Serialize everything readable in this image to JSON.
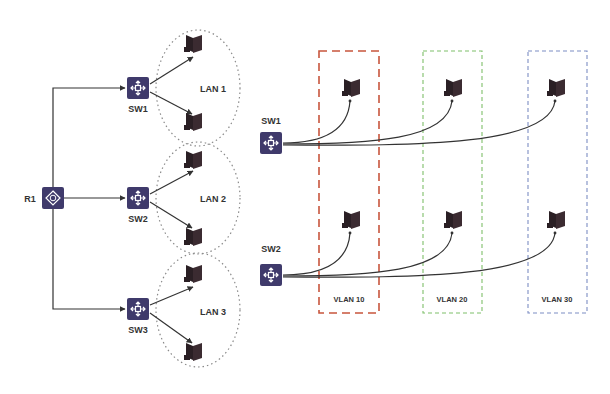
{
  "left_topology": {
    "router": {
      "label": "R1",
      "x": 53,
      "y": 198
    },
    "switches": [
      {
        "label": "SW1",
        "x": 138,
        "y": 88
      },
      {
        "label": "SW2",
        "x": 138,
        "y": 198
      },
      {
        "label": "SW3",
        "x": 138,
        "y": 309
      }
    ],
    "lans": [
      {
        "label": "LAN 1",
        "cx": 198,
        "cy": 88
      },
      {
        "label": "LAN 2",
        "cx": 198,
        "cy": 198
      },
      {
        "label": "LAN 3",
        "cx": 198,
        "cy": 310
      }
    ]
  },
  "right_topology": {
    "switches": [
      {
        "label": "SW1",
        "x": 271,
        "y": 143
      },
      {
        "label": "SW2",
        "x": 271,
        "y": 275
      }
    ],
    "vlans": [
      {
        "label": "VLAN 10",
        "color": "#c8553d"
      },
      {
        "label": "VLAN 20",
        "color": "#7fbf6a"
      },
      {
        "label": "VLAN 30",
        "color": "#7d8ec4"
      }
    ]
  },
  "colors": {
    "device": "#3f3a6b",
    "pc": "#2a1f24",
    "line": "#333333",
    "lan_border": "#8a8a8a"
  }
}
